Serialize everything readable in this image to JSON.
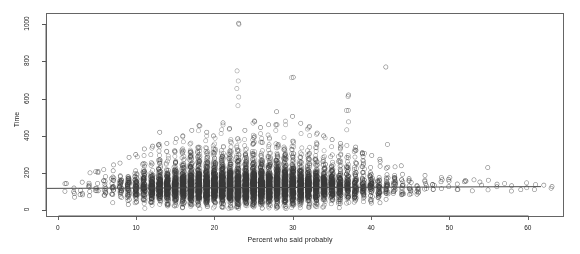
{
  "chart_data": {
    "type": "scatter",
    "title": "",
    "xlabel": "Percent who said probably",
    "ylabel": "Time",
    "xlim": [
      -1.5,
      64.5
    ],
    "ylim": [
      -30,
      1060
    ],
    "xticks": [
      0,
      10,
      20,
      30,
      40,
      50,
      60
    ],
    "xtick_labels": [
      "0",
      "10",
      "20",
      "30",
      "40",
      "50",
      "60"
    ],
    "yticks": [
      0,
      200,
      400,
      600,
      800,
      1000
    ],
    "ytick_labels": [
      "0",
      "200",
      "400",
      "600",
      "800",
      "1000"
    ],
    "grid": false,
    "legend": null,
    "marker": "open-circle",
    "marker_size": 2.1,
    "marker_color": "#3a3a3a",
    "frame_color": "#555555",
    "background": "#ffffff",
    "fit_line": {
      "type": "horizontal-regression",
      "y_at_xmin": 118,
      "y_at_xmax": 128,
      "color": "#4a4a4a",
      "width": 1
    },
    "columns": [
      {
        "x": 1,
        "n": 3,
        "median": 120,
        "spread": 55,
        "tail_max": 150
      },
      {
        "x": 2,
        "n": 4,
        "median": 110,
        "spread": 60,
        "tail_max": 175
      },
      {
        "x": 3,
        "n": 5,
        "median": 105,
        "spread": 65,
        "tail_max": 190
      },
      {
        "x": 4,
        "n": 7,
        "median": 115,
        "spread": 70,
        "tail_max": 205
      },
      {
        "x": 5,
        "n": 9,
        "median": 112,
        "spread": 70,
        "tail_max": 215
      },
      {
        "x": 6,
        "n": 14,
        "median": 118,
        "spread": 72,
        "tail_max": 230
      },
      {
        "x": 7,
        "n": 20,
        "median": 115,
        "spread": 75,
        "tail_max": 250
      },
      {
        "x": 8,
        "n": 30,
        "median": 118,
        "spread": 78,
        "tail_max": 268
      },
      {
        "x": 9,
        "n": 45,
        "median": 116,
        "spread": 80,
        "tail_max": 285
      },
      {
        "x": 10,
        "n": 80,
        "median": 118,
        "spread": 82,
        "tail_max": 300
      },
      {
        "x": 11,
        "n": 110,
        "median": 120,
        "spread": 85,
        "tail_max": 330
      },
      {
        "x": 12,
        "n": 150,
        "median": 118,
        "spread": 86,
        "tail_max": 345
      },
      {
        "x": 13,
        "n": 190,
        "median": 120,
        "spread": 88,
        "tail_max": 420
      },
      {
        "x": 14,
        "n": 230,
        "median": 122,
        "spread": 90,
        "tail_max": 360
      },
      {
        "x": 15,
        "n": 270,
        "median": 120,
        "spread": 90,
        "tail_max": 385
      },
      {
        "x": 16,
        "n": 320,
        "median": 122,
        "spread": 92,
        "tail_max": 400
      },
      {
        "x": 17,
        "n": 360,
        "median": 120,
        "spread": 92,
        "tail_max": 430
      },
      {
        "x": 18,
        "n": 400,
        "median": 122,
        "spread": 94,
        "tail_max": 455
      },
      {
        "x": 19,
        "n": 430,
        "median": 122,
        "spread": 95,
        "tail_max": 420
      },
      {
        "x": 20,
        "n": 460,
        "median": 124,
        "spread": 96,
        "tail_max": 400
      },
      {
        "x": 21,
        "n": 470,
        "median": 122,
        "spread": 96,
        "tail_max": 470
      },
      {
        "x": 22,
        "n": 480,
        "median": 124,
        "spread": 98,
        "tail_max": 440
      },
      {
        "x": 23,
        "n": 470,
        "median": 122,
        "spread": 98,
        "tail_max": 1005
      },
      {
        "x": 24,
        "n": 460,
        "median": 124,
        "spread": 98,
        "tail_max": 430
      },
      {
        "x": 25,
        "n": 450,
        "median": 124,
        "spread": 99,
        "tail_max": 480
      },
      {
        "x": 26,
        "n": 430,
        "median": 122,
        "spread": 99,
        "tail_max": 445
      },
      {
        "x": 27,
        "n": 420,
        "median": 124,
        "spread": 100,
        "tail_max": 460
      },
      {
        "x": 28,
        "n": 400,
        "median": 124,
        "spread": 100,
        "tail_max": 530
      },
      {
        "x": 29,
        "n": 380,
        "median": 124,
        "spread": 100,
        "tail_max": 495
      },
      {
        "x": 30,
        "n": 350,
        "median": 126,
        "spread": 100,
        "tail_max": 715
      },
      {
        "x": 31,
        "n": 320,
        "median": 124,
        "spread": 100,
        "tail_max": 470
      },
      {
        "x": 32,
        "n": 290,
        "median": 126,
        "spread": 100,
        "tail_max": 450
      },
      {
        "x": 33,
        "n": 250,
        "median": 124,
        "spread": 100,
        "tail_max": 415
      },
      {
        "x": 34,
        "n": 210,
        "median": 126,
        "spread": 100,
        "tail_max": 400
      },
      {
        "x": 35,
        "n": 180,
        "median": 124,
        "spread": 98,
        "tail_max": 380
      },
      {
        "x": 36,
        "n": 145,
        "median": 126,
        "spread": 96,
        "tail_max": 360
      },
      {
        "x": 37,
        "n": 115,
        "median": 124,
        "spread": 94,
        "tail_max": 620
      },
      {
        "x": 38,
        "n": 90,
        "median": 126,
        "spread": 92,
        "tail_max": 340
      },
      {
        "x": 39,
        "n": 70,
        "median": 124,
        "spread": 90,
        "tail_max": 310
      },
      {
        "x": 40,
        "n": 52,
        "median": 126,
        "spread": 88,
        "tail_max": 295
      },
      {
        "x": 41,
        "n": 40,
        "median": 124,
        "spread": 85,
        "tail_max": 275
      },
      {
        "x": 42,
        "n": 30,
        "median": 126,
        "spread": 82,
        "tail_max": 770
      },
      {
        "x": 43,
        "n": 22,
        "median": 126,
        "spread": 80,
        "tail_max": 255
      },
      {
        "x": 44,
        "n": 16,
        "median": 124,
        "spread": 76,
        "tail_max": 240
      },
      {
        "x": 45,
        "n": 12,
        "median": 126,
        "spread": 72,
        "tail_max": 225
      },
      {
        "x": 46,
        "n": 9,
        "median": 126,
        "spread": 68,
        "tail_max": 210
      },
      {
        "x": 47,
        "n": 7,
        "median": 124,
        "spread": 65,
        "tail_max": 200
      },
      {
        "x": 48,
        "n": 5,
        "median": 126,
        "spread": 60,
        "tail_max": 195
      },
      {
        "x": 49,
        "n": 4,
        "median": 126,
        "spread": 58,
        "tail_max": 185
      },
      {
        "x": 50,
        "n": 4,
        "median": 126,
        "spread": 55,
        "tail_max": 180
      },
      {
        "x": 51,
        "n": 3,
        "median": 124,
        "spread": 52,
        "tail_max": 175
      },
      {
        "x": 52,
        "n": 3,
        "median": 126,
        "spread": 50,
        "tail_max": 170
      },
      {
        "x": 53,
        "n": 2,
        "median": 126,
        "spread": 48,
        "tail_max": 165
      },
      {
        "x": 54,
        "n": 2,
        "median": 128,
        "spread": 46,
        "tail_max": 160
      },
      {
        "x": 55,
        "n": 2,
        "median": 126,
        "spread": 45,
        "tail_max": 230
      },
      {
        "x": 56,
        "n": 2,
        "median": 128,
        "spread": 44,
        "tail_max": 158
      },
      {
        "x": 57,
        "n": 1,
        "median": 128,
        "spread": 40,
        "tail_max": 150
      },
      {
        "x": 58,
        "n": 2,
        "median": 126,
        "spread": 40,
        "tail_max": 150
      },
      {
        "x": 59,
        "n": 1,
        "median": 128,
        "spread": 38,
        "tail_max": 145
      },
      {
        "x": 60,
        "n": 2,
        "median": 128,
        "spread": 38,
        "tail_max": 148
      },
      {
        "x": 61,
        "n": 2,
        "median": 126,
        "spread": 36,
        "tail_max": 142
      },
      {
        "x": 62,
        "n": 1,
        "median": 128,
        "spread": 34,
        "tail_max": 140
      },
      {
        "x": 63,
        "n": 2,
        "median": 128,
        "spread": 34,
        "tail_max": 138
      }
    ],
    "outliers": [
      {
        "x": 23,
        "y": 1005
      },
      {
        "x": 42,
        "y": 770
      },
      {
        "x": 30,
        "y": 715
      },
      {
        "x": 37,
        "y": 620
      },
      {
        "x": 28,
        "y": 530
      },
      {
        "x": 30,
        "y": 505
      },
      {
        "x": 25,
        "y": 480
      },
      {
        "x": 21,
        "y": 470
      },
      {
        "x": 31,
        "y": 468
      },
      {
        "x": 27,
        "y": 460
      },
      {
        "x": 18,
        "y": 455
      },
      {
        "x": 26,
        "y": 445
      },
      {
        "x": 32,
        "y": 450
      },
      {
        "x": 22,
        "y": 440
      },
      {
        "x": 17,
        "y": 430
      },
      {
        "x": 24,
        "y": 430
      },
      {
        "x": 13,
        "y": 420
      },
      {
        "x": 19,
        "y": 420
      },
      {
        "x": 33,
        "y": 415
      },
      {
        "x": 16,
        "y": 400
      },
      {
        "x": 20,
        "y": 400
      },
      {
        "x": 34,
        "y": 400
      },
      {
        "x": 15,
        "y": 385
      },
      {
        "x": 35,
        "y": 380
      },
      {
        "x": 14,
        "y": 360
      },
      {
        "x": 36,
        "y": 360
      },
      {
        "x": 12,
        "y": 345
      },
      {
        "x": 38,
        "y": 340
      },
      {
        "x": 11,
        "y": 330
      },
      {
        "x": 39,
        "y": 310
      },
      {
        "x": 10,
        "y": 300
      },
      {
        "x": 40,
        "y": 295
      },
      {
        "x": 9,
        "y": 285
      },
      {
        "x": 41,
        "y": 275
      },
      {
        "x": 55,
        "y": 230
      }
    ]
  },
  "plot_geometry": {
    "frame_left": 46,
    "frame_right": 563,
    "frame_top": 13,
    "frame_bottom": 216
  }
}
